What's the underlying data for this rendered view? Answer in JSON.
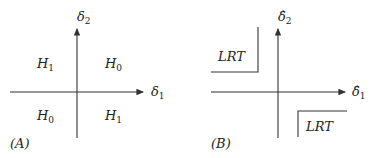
{
  "panels": [
    {
      "id": "A",
      "caption": "(A)",
      "x_axis_label": "δ",
      "x_axis_sub": "1",
      "y_axis_label": "δ",
      "y_axis_sub": "2",
      "regions": {
        "top_left": {
          "main": "H",
          "sub": "1"
        },
        "top_right": {
          "main": "H",
          "sub": "0"
        },
        "bottom_left": {
          "main": "H",
          "sub": "0"
        },
        "bottom_right": {
          "main": "H",
          "sub": "1"
        }
      }
    },
    {
      "id": "B",
      "caption": "(B)",
      "x_axis_label": "δ̂",
      "x_axis_sub": "1",
      "y_axis_label": "δ̂",
      "y_axis_sub": "2",
      "regions": {
        "top_left": {
          "main": "LRT"
        },
        "bottom_right": {
          "main": "LRT"
        }
      }
    }
  ]
}
